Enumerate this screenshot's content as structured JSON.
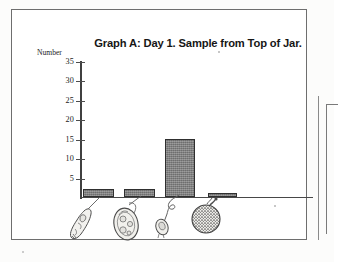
{
  "page": {
    "background_color": "#fcfcfb",
    "panel_border_color": "#6e6e6e"
  },
  "chart_data": {
    "type": "bar",
    "title": "Graph A: Day 1. Sample from Top of Jar.",
    "ylabel": "Number",
    "xlabel": "",
    "categories": [
      "organism-1",
      "organism-2",
      "organism-3",
      "organism-4"
    ],
    "values": [
      2,
      2,
      15,
      1
    ],
    "ylim": [
      0,
      35
    ],
    "yticks": [
      5,
      10,
      15,
      20,
      25,
      30,
      35
    ],
    "ytick_labels": [
      "5",
      "10",
      "15",
      "20",
      "25",
      "30",
      "35"
    ],
    "grid": false,
    "legend": "none",
    "bar_fill_color": "#7c7c7c",
    "bar_edge_color": "#2f2f2f",
    "axis_color": "#484848",
    "category_icons": [
      "elongated-flagellate-icon",
      "oval-ciliate-icon",
      "small-stalked-organism-icon",
      "round-speckled-organism-icon"
    ]
  },
  "axis": {
    "tick_35": "35",
    "tick_30": "30",
    "tick_25": "25",
    "tick_20": "20",
    "tick_15": "15",
    "tick_10": "10",
    "tick_5": "5"
  }
}
